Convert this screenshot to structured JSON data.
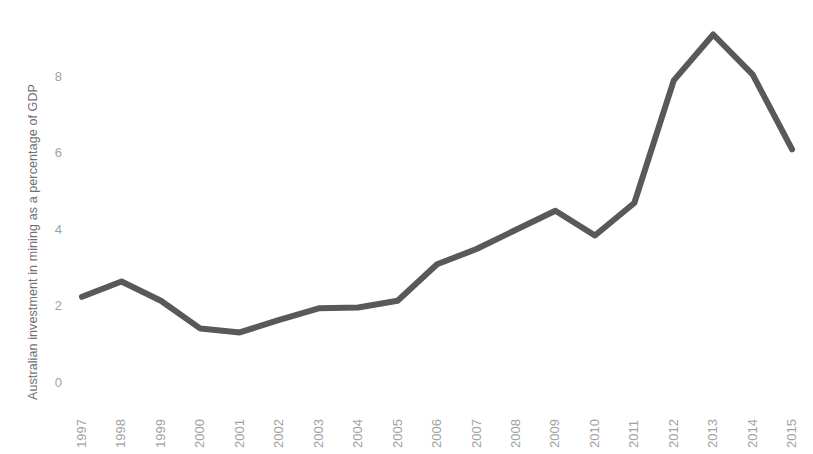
{
  "chart_data": {
    "type": "line",
    "title": "",
    "xlabel": "",
    "ylabel": "Australian investment in mining as a percentage of GDP",
    "x": [
      1997,
      1998,
      1999,
      2000,
      2001,
      2002,
      2003,
      2004,
      2005,
      2006,
      2007,
      2008,
      2009,
      2010,
      2011,
      2012,
      2013,
      2014,
      2015
    ],
    "categories": [
      "1997",
      "1998",
      "1999",
      "2000",
      "2001",
      "2002",
      "2003",
      "2004",
      "2005",
      "2006",
      "2007",
      "2008",
      "2009",
      "2010",
      "2011",
      "2012",
      "2013",
      "2014",
      "2015"
    ],
    "values": [
      2.25,
      2.65,
      2.15,
      1.42,
      1.32,
      1.65,
      1.95,
      1.97,
      2.15,
      3.1,
      3.5,
      4.0,
      4.5,
      3.85,
      4.7,
      7.9,
      9.1,
      8.05,
      6.1
    ],
    "series": [
      {
        "name": "Australian investment in mining as a percentage of GDP",
        "values": [
          2.25,
          2.65,
          2.15,
          1.42,
          1.32,
          1.65,
          1.95,
          1.97,
          2.15,
          3.1,
          3.5,
          4.0,
          4.5,
          3.85,
          4.7,
          7.9,
          9.1,
          8.05,
          6.1
        ],
        "color": "#58595b"
      }
    ],
    "ylim": [
      0,
      9.6
    ],
    "yticks": [
      0,
      2,
      4,
      6,
      8
    ],
    "ytick_labels": [
      "0",
      "2",
      "4",
      "6",
      "8"
    ],
    "grid": false,
    "legend": "none",
    "line_width": 6,
    "markers": false,
    "xtick_rotation": -90,
    "background_color": "#ffffff",
    "tick_label_color": "#a0a3a2",
    "axis_label_color": "#6f7271"
  }
}
